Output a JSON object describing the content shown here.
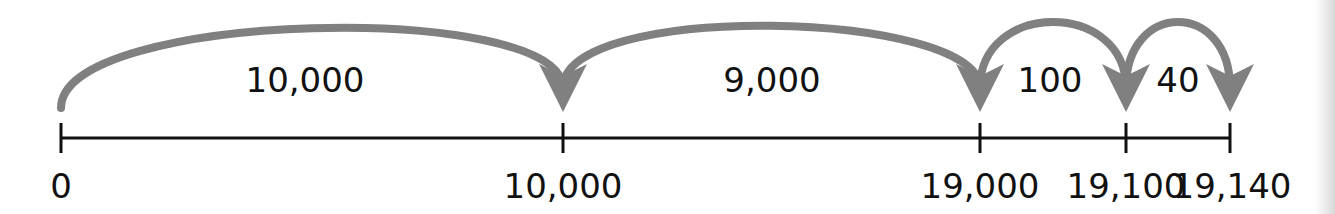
{
  "diagram": {
    "type": "number_line_jumps",
    "arc_color": "#808080",
    "line_color": "#111111",
    "ticks": [
      {
        "value": 0,
        "label": "0",
        "x": 61
      },
      {
        "value": 10000,
        "label": "10,000",
        "x": 563
      },
      {
        "value": 19000,
        "label": "19,000",
        "x": 980
      },
      {
        "value": 19100,
        "label": "19,100",
        "x": 1126
      },
      {
        "value": 19140,
        "label": "19,140",
        "x": 1230
      }
    ],
    "jumps": [
      {
        "from": 0,
        "to": 10000,
        "label": "10,000"
      },
      {
        "from": 10000,
        "to": 19000,
        "label": "9,000"
      },
      {
        "from": 19000,
        "to": 19100,
        "label": "100"
      },
      {
        "from": 19100,
        "to": 19140,
        "label": "40"
      }
    ]
  }
}
